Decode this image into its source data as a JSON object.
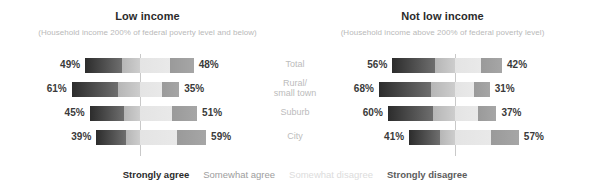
{
  "chart_data": {
    "type": "bar",
    "subtype": "diverging-stacked-bar",
    "title": "",
    "xlabel": "",
    "ylabel": "",
    "grid": false,
    "legend_position": "bottom",
    "categories": [
      "Total",
      "Rural/\nsmall town",
      "Suburb",
      "City"
    ],
    "response_options": [
      "Strongly agree",
      "Somewhat agree",
      "Somewhat disagree",
      "Strongly disagree"
    ],
    "panels": [
      {
        "title": "Low income",
        "subtitle": "(Household income 200% of federal poverty level and below)",
        "rows": [
          {
            "category": "Total",
            "agree_total": 49,
            "disagree_total": 48,
            "agree_label": "49%",
            "disagree_label": "48%"
          },
          {
            "category": "Rural/small town",
            "agree_total": 61,
            "disagree_total": 35,
            "agree_label": "61%",
            "disagree_label": "35%"
          },
          {
            "category": "Suburb",
            "agree_total": 45,
            "disagree_total": 51,
            "agree_label": "45%",
            "disagree_label": "51%"
          },
          {
            "category": "City",
            "agree_total": 39,
            "disagree_total": 59,
            "agree_label": "39%",
            "disagree_label": "59%"
          }
        ]
      },
      {
        "title": "Not low income",
        "subtitle": "(Household income above 200% of federal poverty level)",
        "rows": [
          {
            "category": "Total",
            "agree_total": 56,
            "disagree_total": 42,
            "agree_label": "56%",
            "disagree_label": "42%"
          },
          {
            "category": "Rural/small town",
            "agree_total": 68,
            "disagree_total": 31,
            "agree_label": "68%",
            "disagree_label": "31%"
          },
          {
            "category": "Suburb",
            "agree_total": 60,
            "disagree_total": 37,
            "agree_label": "60%",
            "disagree_label": "37%"
          },
          {
            "category": "City",
            "agree_total": 41,
            "disagree_total": 57,
            "agree_label": "41%",
            "disagree_label": "57%"
          }
        ]
      }
    ],
    "colors": {
      "strongly_agree": "#2c2c2c",
      "somewhat_agree": "#c0c0c0",
      "somewhat_disagree": "#e6e6e6",
      "strongly_disagree": "#a0a0a0",
      "center_rule": "#c9c9c9",
      "category_label": "#bcbcbc",
      "subtitle": "#b9b9b9"
    }
  },
  "panel_left": {
    "title": "Low income",
    "subtitle": "(Household income 200% of federal poverty level and below)",
    "rows": [
      {
        "left_pct": "49%",
        "right_pct": "48%"
      },
      {
        "left_pct": "61%",
        "right_pct": "35%"
      },
      {
        "left_pct": "45%",
        "right_pct": "51%"
      },
      {
        "left_pct": "39%",
        "right_pct": "59%"
      }
    ]
  },
  "panel_right": {
    "title": "Not low income",
    "subtitle": "(Household income above 200% of federal poverty level)",
    "rows": [
      {
        "left_pct": "56%",
        "right_pct": "42%"
      },
      {
        "left_pct": "68%",
        "right_pct": "31%"
      },
      {
        "left_pct": "60%",
        "right_pct": "37%"
      },
      {
        "left_pct": "41%",
        "right_pct": "57%"
      }
    ]
  },
  "categories": [
    {
      "line1": "Total",
      "line2": ""
    },
    {
      "line1": "Rural/",
      "line2": "small town"
    },
    {
      "line1": "Suburb",
      "line2": ""
    },
    {
      "line1": "City",
      "line2": ""
    }
  ],
  "legend": {
    "strongly_agree": "Strongly agree",
    "somewhat_agree": "Somewhat agree",
    "somewhat_disagree": "Somewhat disagree",
    "strongly_disagree": "Strongly disagree"
  }
}
